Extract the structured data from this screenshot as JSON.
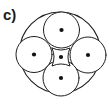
{
  "figure": {
    "panel_label": "c)",
    "caption": "",
    "background_color": "#ffffff",
    "stroke_color": "#1e1e1e",
    "dot_color": "#111111",
    "fill_color": "#ffffff",
    "canvas": {
      "width": 109,
      "height": 104
    }
  },
  "diagram": {
    "type": "packing-diagram",
    "outer_circle": {
      "name": "outer-boundary-circle",
      "cx": 60,
      "cy": 52.5,
      "r": 40.5,
      "stroke_width": 1.1
    },
    "inner_circles": [
      {
        "name": "inner-circle-top",
        "cx": 61.5,
        "cy": 30.0,
        "r": 18.0,
        "stroke_width": 1.0
      },
      {
        "name": "inner-circle-left",
        "cx": 34.0,
        "cy": 54.5,
        "r": 18.0,
        "stroke_width": 1.0
      },
      {
        "name": "inner-circle-right",
        "cx": 88.0,
        "cy": 55.0,
        "r": 18.0,
        "stroke_width": 1.0
      },
      {
        "name": "inner-circle-bottom",
        "cx": 61.0,
        "cy": 78.0,
        "r": 18.0,
        "stroke_width": 1.0
      }
    ],
    "center_region": {
      "name": "central-curved-square",
      "cx": 61.0,
      "cy": 57.0,
      "half_width": 9.0,
      "stroke_width": 1.0
    },
    "dots": [
      {
        "name": "dot-top",
        "cx": 61.5,
        "cy": 30.0,
        "r": 2.1
      },
      {
        "name": "dot-left",
        "cx": 34.0,
        "cy": 54.5,
        "r": 2.1
      },
      {
        "name": "dot-center",
        "cx": 61.0,
        "cy": 57.0,
        "r": 2.1
      },
      {
        "name": "dot-right",
        "cx": 88.0,
        "cy": 55.0,
        "r": 2.1
      },
      {
        "name": "dot-bottom",
        "cx": 61.0,
        "cy": 78.0,
        "r": 2.1
      }
    ],
    "dot_count": 5,
    "circle_count": 5
  }
}
